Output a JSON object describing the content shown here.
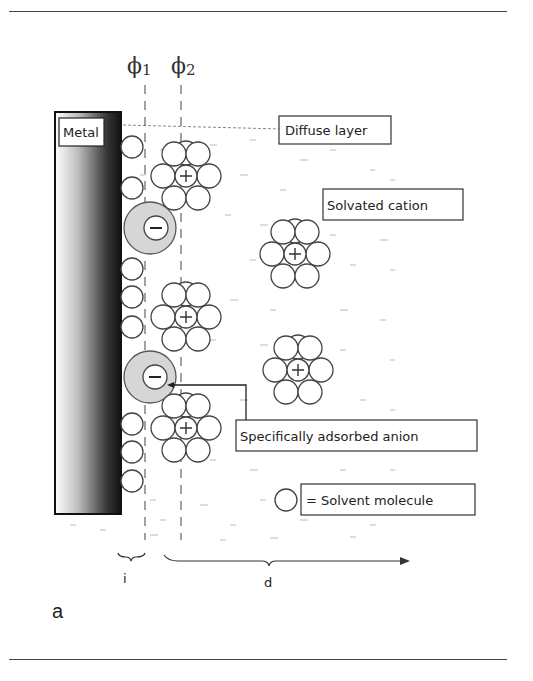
{
  "figure": {
    "panel_label": "a",
    "labels": {
      "phi1": "ϕ",
      "phi1_sub": "1",
      "phi2": "ϕ",
      "phi2_sub": "2",
      "metal": "Metal",
      "diffuse_layer": "Diffuse layer",
      "solvated_cation": "Solvated cation",
      "specifically_adsorbed_anion": "Specifically adsorbed anion",
      "solvent_molecule_legend": "= Solvent molecule",
      "inner_layer": "i",
      "diffuse_region": "d",
      "cation_sign": "+",
      "anion_sign": "−"
    },
    "colors": {
      "metal_dark": "#111111",
      "metal_light": "#ffffff",
      "anion_shell": "#d6d6d6",
      "stroke": "#444444"
    }
  }
}
